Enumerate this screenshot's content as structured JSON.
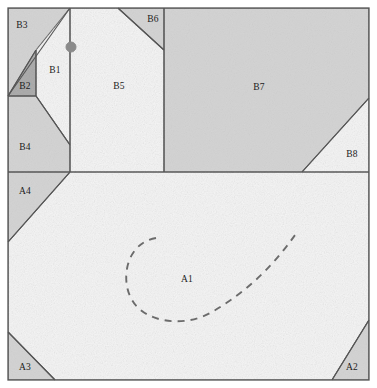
{
  "figure": {
    "width": 377,
    "height": 388,
    "background": "#ffffff",
    "border_color": "#555555",
    "line_color": "#555555",
    "colors": {
      "white_fill": "#f5f5f5",
      "gray_fill": "#d2d2d2",
      "dark_gray_fill": "#a8a8a8",
      "outline": "#555555",
      "dashed_curve": "#6b6b6b",
      "marker_dot": "#8a8a8a",
      "label_text": "#1b1b1b"
    },
    "frame": {
      "x": 8,
      "y": 8,
      "width": 361,
      "height": 372
    },
    "divider_y": 172,
    "marker_dot": {
      "cx": 71,
      "cy": 47,
      "r": 5.0
    }
  },
  "regions": [
    {
      "id": "B3",
      "label": "B3",
      "fill": "gray",
      "label_x": 22,
      "label_y": 26,
      "points": "8,8 70,8 36,96 8,96"
    },
    {
      "id": "B2",
      "label": "B2",
      "fill": "dark_gray",
      "label_x": 25,
      "label_y": 87,
      "points": "8,96 36,96 36,50 8,96"
    },
    {
      "id": "B1",
      "label": "B1",
      "fill": "white",
      "label_x": 55,
      "label_y": 71,
      "points": "70,8 70,145 36,96 36,50"
    },
    {
      "id": "B4",
      "label": "B4",
      "fill": "gray",
      "label_x": 25,
      "label_y": 148,
      "points": "8,96 36,96 70,145 70,172 8,172"
    },
    {
      "id": "B5",
      "label": "B5",
      "fill": "white",
      "label_x": 119,
      "label_y": 87,
      "points": "70,8 118,8 164,50 164,172 70,172"
    },
    {
      "id": "B6",
      "label": "B6",
      "fill": "gray",
      "label_x": 153,
      "label_y": 20,
      "points": "118,8 164,8 164,50"
    },
    {
      "id": "B7",
      "label": "B7",
      "fill": "gray",
      "label_x": 259,
      "label_y": 88,
      "points": "164,8 369,8 369,98 302,172 164,172"
    },
    {
      "id": "B8",
      "label": "B8",
      "fill": "white",
      "label_x": 352,
      "label_y": 155,
      "points": "369,98 369,172 302,172"
    },
    {
      "id": "A1",
      "label": "A1",
      "fill": "white",
      "label_x": 187,
      "label_y": 280,
      "points": "70,172 369,172 369,320 332,380 55,380 8,332 8,242"
    },
    {
      "id": "A4",
      "label": "A4",
      "fill": "gray",
      "label_x": 25,
      "label_y": 192,
      "points": "8,172 70,172 8,242"
    },
    {
      "id": "A3",
      "label": "A3",
      "fill": "gray",
      "label_x": 25,
      "label_y": 368,
      "points": "8,332 55,380 8,380"
    },
    {
      "id": "A2",
      "label": "A2",
      "fill": "gray",
      "label_x": 352,
      "label_y": 368,
      "points": "369,320 369,380 332,380"
    }
  ],
  "internal_lines": [
    {
      "name": "b1-b5-vertical",
      "x1": 70,
      "y1": 8,
      "x2": 70,
      "y2": 172
    },
    {
      "name": "b5-b7-vertical",
      "x1": 164,
      "y1": 8,
      "x2": 164,
      "y2": 172
    },
    {
      "name": "ab-divider",
      "x1": 8,
      "y1": 172,
      "x2": 369,
      "y2": 172
    },
    {
      "name": "b3-b1-diagonal",
      "x1": 70,
      "y1": 8,
      "x2": 8,
      "y2": 96
    },
    {
      "name": "b2-hypotenuse",
      "x1": 36,
      "y1": 50,
      "x2": 8,
      "y2": 96
    },
    {
      "name": "b2-base",
      "x1": 8,
      "y1": 96,
      "x2": 36,
      "y2": 96
    },
    {
      "name": "b2-right-edge",
      "x1": 36,
      "y1": 50,
      "x2": 36,
      "y2": 96
    },
    {
      "name": "b1-b4-diagonal",
      "x1": 36,
      "y1": 96,
      "x2": 70,
      "y2": 145
    },
    {
      "name": "b6-diagonal",
      "x1": 118,
      "y1": 8,
      "x2": 164,
      "y2": 50
    },
    {
      "name": "b7-b8-diagonal",
      "x1": 369,
      "y1": 98,
      "x2": 302,
      "y2": 172
    },
    {
      "name": "a4-diagonal",
      "x1": 70,
      "y1": 172,
      "x2": 8,
      "y2": 242
    },
    {
      "name": "a3-diagonal",
      "x1": 8,
      "y1": 332,
      "x2": 55,
      "y2": 380
    },
    {
      "name": "a2-diagonal",
      "x1": 369,
      "y1": 320,
      "x2": 332,
      "y2": 380
    }
  ],
  "dashed_curve": {
    "name": "hook-curve",
    "path": "M 156 238 C 126 243 120 280 132 300 C 145 323 185 328 212 312 C 250 290 276 262 295 235",
    "dash": "7 6",
    "stroke_width": 1.9
  }
}
